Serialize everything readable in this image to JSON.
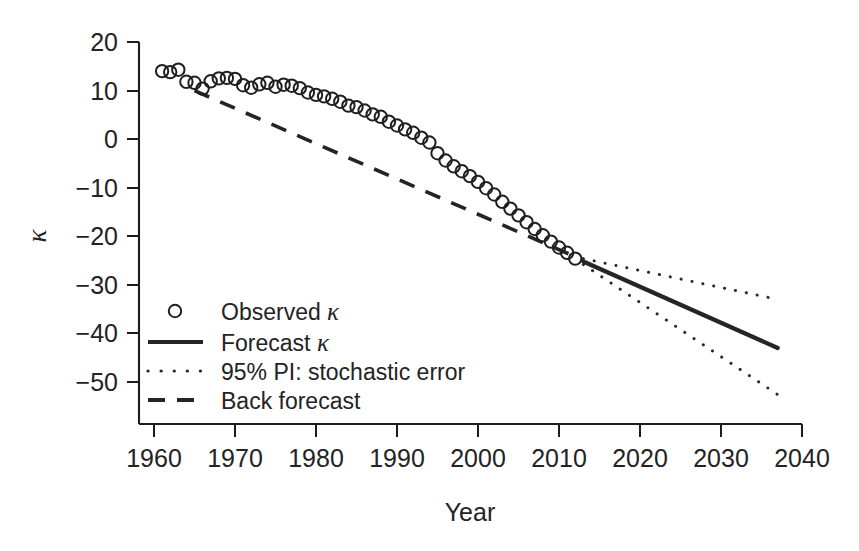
{
  "chart_data": {
    "type": "line",
    "title": "",
    "xlabel": "Year",
    "ylabel": "κ",
    "xlim": [
      1958,
      2042
    ],
    "ylim": [
      -55,
      22
    ],
    "xticks": [
      1960,
      1970,
      1980,
      1990,
      2000,
      2010,
      2020,
      2030,
      2040
    ],
    "xtick_labels": [
      "1960",
      "1970",
      "1980",
      "1990",
      "2000",
      "2010",
      "2020",
      "2030",
      "2040"
    ],
    "yticks": [
      20,
      10,
      0,
      -10,
      -20,
      -30,
      -40,
      -50
    ],
    "ytick_labels": [
      "20",
      "10",
      "0",
      "−10",
      "−20",
      "−30",
      "−40",
      "−50"
    ],
    "grid": false,
    "legend_position": "lower-left",
    "series": [
      {
        "name": "Observed κ",
        "type": "scatter",
        "marker": "open-circle",
        "x": [
          1961,
          1962,
          1963,
          1964,
          1965,
          1966,
          1967,
          1968,
          1969,
          1970,
          1971,
          1972,
          1973,
          1974,
          1975,
          1976,
          1977,
          1978,
          1979,
          1980,
          1981,
          1982,
          1983,
          1984,
          1985,
          1986,
          1987,
          1988,
          1989,
          1990,
          1991,
          1992,
          1993,
          1994,
          1995,
          1996,
          1997,
          1998,
          1999,
          2000,
          2001,
          2002,
          2003,
          2004,
          2005,
          2006,
          2007,
          2008,
          2009,
          2010,
          2011,
          2012
        ],
        "values": [
          14.0,
          13.8,
          14.3,
          11.8,
          11.6,
          10.4,
          11.9,
          12.5,
          12.6,
          12.4,
          11.1,
          10.6,
          11.3,
          11.6,
          10.8,
          11.2,
          11.0,
          10.5,
          9.6,
          9.1,
          8.8,
          8.3,
          7.7,
          6.9,
          6.6,
          5.9,
          5.1,
          4.6,
          3.6,
          2.8,
          2.0,
          1.3,
          0.3,
          -0.7,
          -2.9,
          -4.4,
          -5.6,
          -6.6,
          -7.6,
          -8.8,
          -10.1,
          -11.4,
          -12.9,
          -14.3,
          -15.7,
          -17.1,
          -18.5,
          -19.8,
          -21.1,
          -22.3,
          -23.4,
          -24.6
        ]
      },
      {
        "name": "Forecast κ",
        "type": "line",
        "style": "solid",
        "x": [
          2013,
          2037
        ],
        "values": [
          -25.2,
          -43.0
        ]
      },
      {
        "name": "95% PI: stochastic error",
        "type": "line",
        "style": "dotted",
        "bounds": "upper",
        "x": [
          2013,
          2037
        ],
        "values": [
          -24.6,
          -33.0
        ]
      },
      {
        "name": "95% PI: stochastic error",
        "type": "line",
        "style": "dotted",
        "bounds": "lower",
        "x": [
          2013,
          2037
        ],
        "values": [
          -25.8,
          -52.6
        ]
      },
      {
        "name": "Back forecast",
        "type": "line",
        "style": "dashed",
        "x": [
          1965,
          2012
        ],
        "values": [
          10.0,
          -24.2
        ]
      }
    ]
  },
  "legend": {
    "items": [
      {
        "label": "Observed ",
        "kappa": "κ",
        "marker": "open-circle"
      },
      {
        "label": "Forecast ",
        "kappa": "κ",
        "marker": "solid-line"
      },
      {
        "label": "95% PI: stochastic error",
        "kappa": "",
        "marker": "dotted-line"
      },
      {
        "label": "Back forecast",
        "kappa": "",
        "marker": "dashed-line"
      }
    ]
  },
  "axes": {
    "x_title": "Year",
    "y_title": "κ"
  }
}
